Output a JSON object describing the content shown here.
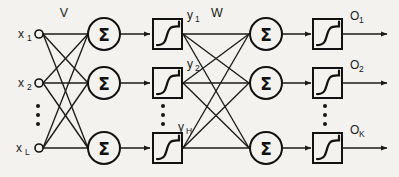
{
  "figure": {
    "background_color": "#f4f2ee",
    "ink_color": "#1b1b1b"
  },
  "weights": {
    "input_to_hidden_label": "V",
    "hidden_to_output_label": "W"
  },
  "input_layer": {
    "nodes": [
      {
        "base": "x",
        "sub": "1"
      },
      {
        "base": "x",
        "sub": "2"
      },
      {
        "base": "x",
        "sub": "L"
      }
    ],
    "ellipsis": "⋮"
  },
  "hidden_sum_layer": {
    "glyph": "Σ",
    "count": 3
  },
  "hidden_activation_layer": {
    "icon": "sigmoid-icon",
    "outputs": [
      {
        "base": "y",
        "sub": "1"
      },
      {
        "base": "y",
        "sub": "2"
      },
      {
        "base": "y",
        "sub": "H"
      }
    ],
    "ellipsis": "⋮"
  },
  "output_sum_layer": {
    "glyph": "Σ",
    "count": 3
  },
  "output_activation_layer": {
    "icon": "sigmoid-icon",
    "outputs": [
      {
        "base": "O",
        "sub": "1"
      },
      {
        "base": "O",
        "sub": "2"
      },
      {
        "base": "O",
        "sub": "K"
      }
    ],
    "ellipsis": "⋮"
  }
}
